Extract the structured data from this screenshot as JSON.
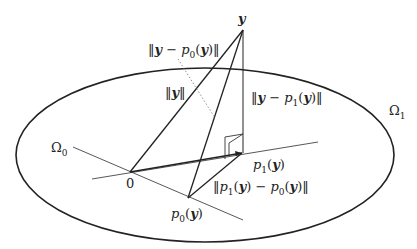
{
  "diagram": {
    "type": "geometric-projection",
    "points": {
      "y": {
        "label": "y",
        "x": 243,
        "y": 30
      },
      "origin": {
        "label": "0",
        "x": 130,
        "y": 172
      },
      "p0": {
        "label": "p0(y)",
        "x": 188,
        "y": 198
      },
      "p1": {
        "label": "p1(y)",
        "x": 242,
        "y": 153
      }
    },
    "regions": {
      "omega1": {
        "label": "Ω1",
        "cx": 205,
        "cy": 155,
        "rx": 189,
        "ry": 87
      },
      "omega0": {
        "label": "Ω0"
      }
    },
    "edges": [
      {
        "name": "norm-y",
        "label": "‖y‖",
        "from": "origin",
        "to": "y"
      },
      {
        "name": "y-minus-p0",
        "label": "‖y − p0(y)‖",
        "from": "p0",
        "to": "y"
      },
      {
        "name": "y-minus-p1",
        "label": "‖y − p1(y)‖",
        "from": "p1",
        "to": "y"
      },
      {
        "name": "p1-minus-p0",
        "label": "‖p1(y) − p0(y)‖",
        "from": "p0",
        "to": "p1"
      },
      {
        "name": "origin-to-p1",
        "label": "",
        "from": "origin",
        "to": "p1"
      }
    ]
  },
  "labels": {
    "y": "y",
    "origin": "0",
    "p0": {
      "fn": "p",
      "sub": "0",
      "arg": "y"
    },
    "p1": {
      "fn": "p",
      "sub": "1",
      "arg": "y"
    },
    "omega0": {
      "sym": "Ω",
      "sub": "0"
    },
    "omega1": {
      "sym": "Ω",
      "sub": "1"
    },
    "norm_y": "‖y‖",
    "norm_y_p0": "‖y − p0(y)‖",
    "norm_y_p1": "‖y − p1(y)‖",
    "norm_p1_p0": "‖p1(y) − p0(y)‖"
  },
  "colors": {
    "stroke": "#222222",
    "thin": "#444444",
    "dotted": "#777777",
    "background": "#ffffff"
  }
}
